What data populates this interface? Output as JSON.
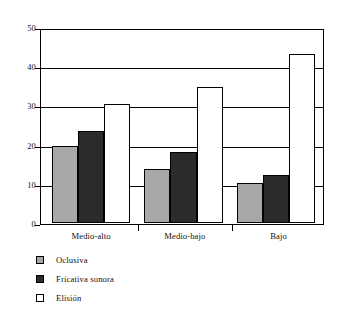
{
  "chart_data": {
    "type": "bar",
    "title": "",
    "subtitle": "",
    "xlabel": "",
    "ylabel": "",
    "categories": [
      "Medio-alto",
      "Medio-bajo",
      "Bajo"
    ],
    "series": [
      {
        "name": "Oclusiva",
        "color": "#a8a8a8",
        "values": [
          20,
          14,
          10.5
        ]
      },
      {
        "name": "Fricativa sonora",
        "color": "#2b2b2b",
        "values": [
          24,
          18.5,
          12.5
        ]
      },
      {
        "name": "Elisión",
        "color": "#ffffff",
        "values": [
          31,
          35.5,
          44
        ]
      }
    ],
    "ylim": [
      0,
      50
    ],
    "yticks": [
      0,
      10,
      20,
      30,
      40,
      50
    ],
    "ytick_labels": [
      "0",
      "10",
      "20",
      "30",
      "40",
      "50"
    ],
    "grid": true,
    "grid_axis": "y",
    "legend_position": "below-left",
    "annotations": []
  },
  "axis": {
    "y_labels": [
      "50",
      "40",
      "30",
      "20",
      "10",
      "0"
    ]
  },
  "legend": {
    "items": [
      {
        "label": "Oclusiva",
        "swatch": "gray-square-icon"
      },
      {
        "label": "Fricativa sonora",
        "swatch": "dark-square-icon"
      },
      {
        "label": "Elisión",
        "swatch": "white-square-icon"
      }
    ]
  },
  "x_axis": {
    "labels": [
      "Medio-alto",
      "Medio-bajo",
      "Bajo"
    ]
  }
}
